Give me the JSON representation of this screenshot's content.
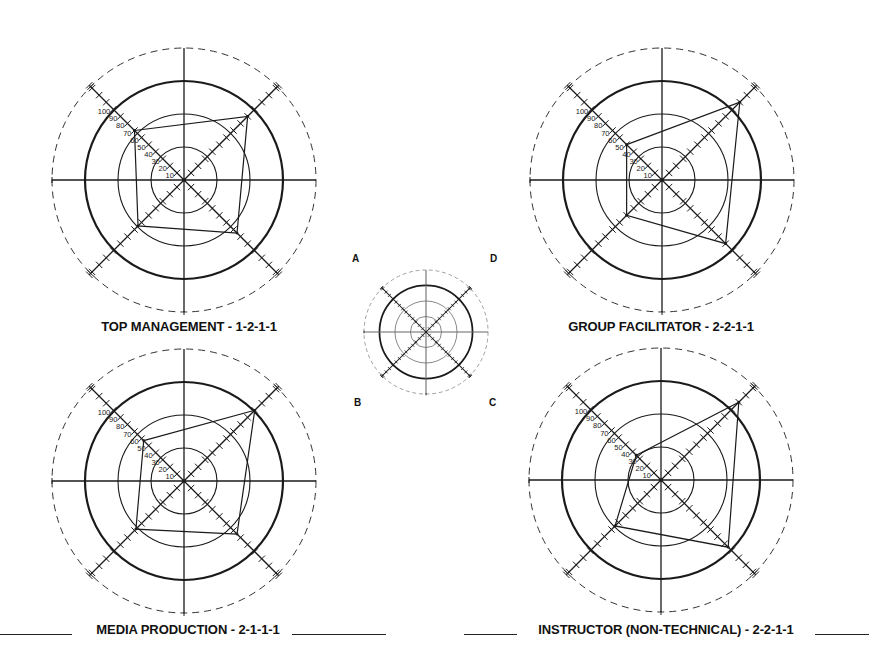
{
  "key_diagram": {
    "quadrant_labels": {
      "upper_left": "A",
      "upper_right": "D",
      "lower_left": "B",
      "lower_right": "C"
    }
  },
  "charts": [
    {
      "title": "TOP MANAGEMENT - 1-2-1-1"
    },
    {
      "title": "GROUP FACILITATOR - 2-2-1-1"
    },
    {
      "title": "MEDIA PRODUCTION - 2-1-1-1"
    },
    {
      "title": "INSTRUCTOR (NON-TECHNICAL) - 2-2-1-1"
    }
  ],
  "scale_labels": [
    "10",
    "20",
    "30",
    "40",
    "50",
    "60",
    "70",
    "80",
    "90",
    "100"
  ],
  "colors": {
    "ink": "#1a1a1a",
    "light_ink": "#555555",
    "background": "#ffffff"
  },
  "chart_data": [
    {
      "type": "radar",
      "title": "TOP MANAGEMENT - 1-2-1-1",
      "axes": [
        "A",
        "D",
        "C",
        "B"
      ],
      "axis_directions": {
        "A": "upper-left",
        "D": "upper-right",
        "C": "lower-right",
        "B": "lower-left"
      },
      "values": {
        "A": 70,
        "D": 90,
        "C": 75,
        "B": 65
      },
      "scale": {
        "min": 0,
        "max": 130,
        "tick_step": 10,
        "labeled_ticks": [
          10,
          20,
          30,
          40,
          50,
          60,
          70,
          80,
          90,
          100
        ]
      },
      "rings": [
        33,
        66,
        100,
        133
      ]
    },
    {
      "type": "radar",
      "title": "GROUP FACILITATOR - 2-2-1-1",
      "axes": [
        "A",
        "D",
        "C",
        "B"
      ],
      "axis_directions": {
        "A": "upper-left",
        "D": "upper-right",
        "C": "lower-right",
        "B": "lower-left"
      },
      "values": {
        "A": 50,
        "D": 110,
        "C": 90,
        "B": 50
      },
      "scale": {
        "min": 0,
        "max": 130,
        "tick_step": 10,
        "labeled_ticks": [
          10,
          20,
          30,
          40,
          50,
          60,
          70,
          80,
          90,
          100
        ]
      },
      "rings": [
        33,
        66,
        100,
        133
      ]
    },
    {
      "type": "radar",
      "title": "MEDIA PRODUCTION - 2-1-1-1",
      "axes": [
        "A",
        "D",
        "C",
        "B"
      ],
      "axis_directions": {
        "A": "upper-left",
        "D": "upper-right",
        "C": "lower-right",
        "B": "lower-left"
      },
      "values": {
        "A": 57,
        "D": 100,
        "C": 75,
        "B": 68
      },
      "scale": {
        "min": 0,
        "max": 130,
        "tick_step": 10,
        "labeled_ticks": [
          10,
          20,
          30,
          40,
          50,
          60,
          70,
          80,
          90,
          100
        ]
      },
      "rings": [
        33,
        66,
        100,
        133
      ]
    },
    {
      "type": "radar",
      "title": "INSTRUCTOR (NON-TECHNICAL) - 2-2-1-1",
      "axes": [
        "A",
        "D",
        "C",
        "B"
      ],
      "axis_directions": {
        "A": "upper-left",
        "D": "upper-right",
        "C": "lower-right",
        "B": "lower-left"
      },
      "values": {
        "A": 35,
        "D": 110,
        "C": 95,
        "B": 65
      },
      "scale": {
        "min": 0,
        "max": 130,
        "tick_step": 10,
        "labeled_ticks": [
          10,
          20,
          30,
          40,
          50,
          60,
          70,
          80,
          90,
          100
        ]
      },
      "rings": [
        33,
        66,
        100,
        133
      ]
    }
  ]
}
